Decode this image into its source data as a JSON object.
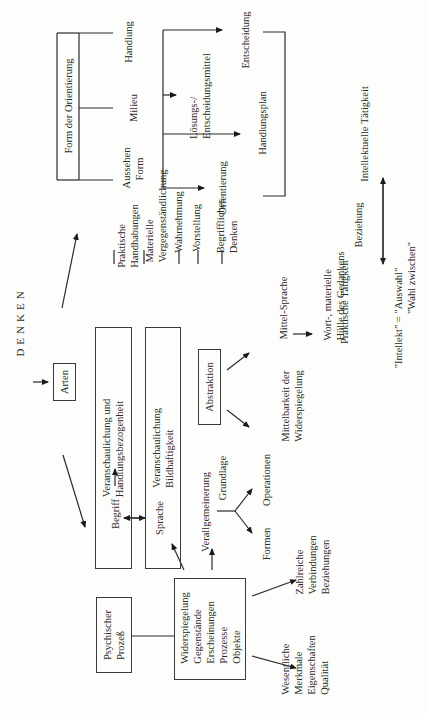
{
  "title": "DENKEN",
  "arten": "Arten",
  "orientation": {
    "box_label": "Form der Orientierung",
    "items": [
      "Aussehen\nForm",
      "Milieu",
      "Handlung"
    ],
    "aussehen": [
      "Aussehen",
      "Form"
    ],
    "milieu": "Milieu",
    "handlung": "Handlung",
    "loesungsmittel": [
      "Lösungs-/",
      "Entscheidungsmittel"
    ],
    "entscheidung": "Entscheidung",
    "orientierung": "Orientierung",
    "handlungsplan": "Handlungsplan"
  },
  "activities": {
    "intellektuelle": "Intellektuelle Tätigkeit",
    "beziehung": "Beziehung",
    "praktische": "Praktische Tätigkeit",
    "intellekt_line1": "\"Intellekt\"  = \"Auswahl\"",
    "intellekt_line2": "\"Wahl zwischen\""
  },
  "types": {
    "box1": [
      "Veranschaulichung und",
      "Handlungsbezogenheit"
    ],
    "box2": [
      "Veranschaulichung",
      "Bildhaftigkeit"
    ],
    "box3": "Abstraktion",
    "praktische_handhabungen": [
      "Praktische",
      "Handhabungen"
    ],
    "materielle": [
      "Materielle",
      "Vergegenständlichung"
    ],
    "wahrnehmung": "Wahrnehmung",
    "vorstellung": "Vorstellung",
    "begriffliches": [
      "Begriffliches",
      "Denken"
    ]
  },
  "language": {
    "mittel_sprache": "Mittel-Sprache",
    "mittelbarkeit": [
      "Mittelbarkeit der",
      "Widerspiegelung"
    ],
    "wort": [
      "Wort-, materielle",
      "Hülle des Gedankens"
    ],
    "begriff": "Begriff",
    "sprache": "Sprache"
  },
  "generalization": {
    "verallgemeinerung": "Verallgemeinerung",
    "grundlage": "Grundlage",
    "formen": "Formen",
    "operationen": "Operationen"
  },
  "process": {
    "psychischer": [
      "Psychischer",
      "Prozeß"
    ],
    "widerspiegelung": [
      "Widerspiegelung",
      "Gegenstände",
      "Erscheinungen",
      "Prozesse",
      "Objekte"
    ],
    "wesentliche": [
      "Wesentliche",
      "Merkmale",
      "Eigenschaften",
      "Qualität"
    ],
    "zahlreiche": [
      "Zahlreiche",
      "Verbindungen",
      "Beziehungen"
    ]
  },
  "colors": {
    "ink": "#2a2a2a",
    "paper": "#fdfdfc"
  }
}
